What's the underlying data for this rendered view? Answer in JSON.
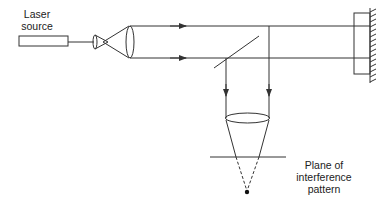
{
  "diagram": {
    "type": "Michelson-style interferometer with beam expander",
    "labels": {
      "laser_source_line1": "Laser",
      "laser_source_line2": "source",
      "plane_line1": "Plane of",
      "plane_line2": "interference",
      "plane_line3": "pattern"
    },
    "components": [
      "laser-source",
      "beam-expander-lens-small",
      "collimating-lens",
      "beam-splitter",
      "mirror",
      "reference-block",
      "focusing-lens",
      "interference-plane",
      "focal-point"
    ],
    "colors": {
      "stroke": "#333333",
      "background": "#ffffff"
    }
  }
}
